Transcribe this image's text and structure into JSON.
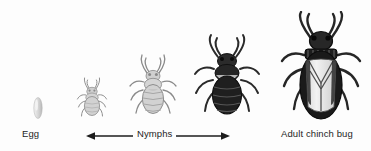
{
  "figure": {
    "background_color": "#fdfdfd"
  },
  "labels": {
    "egg": "Egg",
    "nymphs": "Nymphs",
    "adult": "Adult chinch bug"
  },
  "stages": [
    {
      "id": "egg",
      "name": "egg",
      "label": "Egg",
      "color": "#d8d8d8",
      "outline": "#9a9a9a",
      "relative_size": 1
    },
    {
      "id": "nymph-1",
      "name": "first-instar-nymph",
      "label": "Nymph",
      "color": "#c9c9c9",
      "outline": "#8c8c8c",
      "relative_size": 2
    },
    {
      "id": "nymph-2",
      "name": "second-instar-nymph",
      "label": "Nymph",
      "color": "#cdcdcd",
      "outline": "#8a8a8a",
      "relative_size": 3
    },
    {
      "id": "nymph-3",
      "name": "late-instar-nymph",
      "label": "Nymph",
      "color": "#2b2b2b",
      "outline": "#141414",
      "relative_size": 4
    },
    {
      "id": "adult",
      "name": "adult-chinch-bug",
      "label": "Adult chinch bug",
      "color": "#252525",
      "wing_color": "#e6e6e6",
      "outline": "#121212",
      "relative_size": 5
    }
  ],
  "arrow": {
    "name": "nymphs-range-arrow",
    "direction": "double",
    "color": "#1d1d1d",
    "spans_stages": [
      "nymph-1",
      "nymph-3"
    ]
  },
  "colors": {
    "text": "#1d1d1d",
    "background": "#fdfdfd",
    "light_gray": "#cdcdcd",
    "dark": "#222222"
  }
}
